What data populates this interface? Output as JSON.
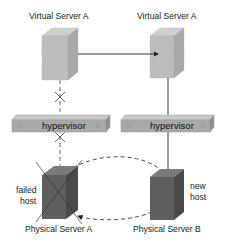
{
  "diagram": {
    "top_left_label": "Virtual Server A",
    "top_right_label": "Virtual Server A",
    "hypervisor_left_label": "hypervisor",
    "hypervisor_right_label": "hypervisor",
    "bottom_left_label": "Physical Server A",
    "bottom_right_label": "Physical Server B",
    "failed_host_line1": "failed",
    "failed_host_line2": "host",
    "new_host_line1": "new",
    "new_host_line2": "host"
  },
  "colors": {
    "virtual_server": "#b8b8b8",
    "physical_server": "#5f5f5f",
    "hypervisor": "#a9a9a9",
    "line": "#222222"
  }
}
